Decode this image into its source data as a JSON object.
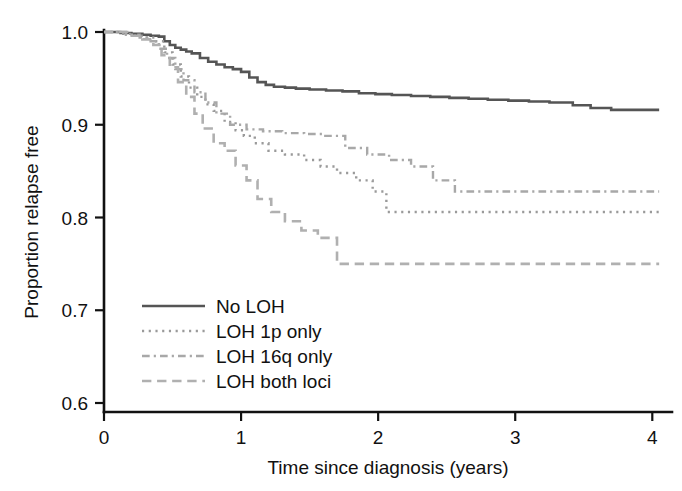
{
  "chart_data": {
    "type": "line",
    "title": "",
    "subtitle": "",
    "xlabel": "Time since diagnosis (years)",
    "ylabel": "Proportion relapse free",
    "xlim": [
      0,
      4.1
    ],
    "ylim": [
      0.6,
      1.0
    ],
    "xticks": [
      0,
      1,
      2,
      3,
      4
    ],
    "xtick_labels": [
      "0",
      "1",
      "2",
      "3",
      "4"
    ],
    "yticks": [
      0.6,
      0.7,
      0.8,
      0.9,
      1.0
    ],
    "ytick_labels": [
      "0.6",
      "0.7",
      "0.8",
      "0.9",
      "1.0"
    ],
    "grid": false,
    "legend_position": "lower-left-inside",
    "step_type": "post",
    "series": [
      {
        "name": "No LOH",
        "dash_style": "solid",
        "color": "#555555",
        "stroke_width": 2.6,
        "x": [
          0.0,
          0.12,
          0.2,
          0.28,
          0.34,
          0.4,
          0.44,
          0.48,
          0.52,
          0.56,
          0.6,
          0.64,
          0.7,
          0.76,
          0.82,
          0.88,
          0.94,
          1.0,
          1.06,
          1.12,
          1.18,
          1.24,
          1.32,
          1.4,
          1.5,
          1.62,
          1.74,
          1.86,
          1.98,
          2.1,
          2.24,
          2.38,
          2.52,
          2.66,
          2.8,
          2.95,
          3.1,
          3.25,
          3.42,
          3.55,
          3.7,
          4.05
        ],
        "y": [
          1.0,
          0.999,
          0.998,
          0.997,
          0.996,
          0.995,
          0.99,
          0.986,
          0.983,
          0.981,
          0.979,
          0.977,
          0.972,
          0.968,
          0.965,
          0.962,
          0.96,
          0.957,
          0.951,
          0.946,
          0.943,
          0.941,
          0.94,
          0.939,
          0.938,
          0.937,
          0.936,
          0.934,
          0.933,
          0.932,
          0.931,
          0.93,
          0.929,
          0.928,
          0.927,
          0.926,
          0.925,
          0.924,
          0.921,
          0.918,
          0.916,
          0.916
        ]
      },
      {
        "name": "LOH 1p only",
        "dash_style": "dotted",
        "color": "#9a9a9a",
        "stroke_width": 2.4,
        "x": [
          0.0,
          0.14,
          0.22,
          0.3,
          0.38,
          0.44,
          0.5,
          0.56,
          0.62,
          0.68,
          0.74,
          0.8,
          0.88,
          0.96,
          1.02,
          1.1,
          1.2,
          1.32,
          1.46,
          1.58,
          1.7,
          1.84,
          1.96,
          2.06,
          4.05
        ],
        "y": [
          1.0,
          0.998,
          0.996,
          0.994,
          0.99,
          0.978,
          0.965,
          0.952,
          0.94,
          0.93,
          0.922,
          0.915,
          0.903,
          0.894,
          0.888,
          0.88,
          0.872,
          0.868,
          0.862,
          0.855,
          0.848,
          0.84,
          0.828,
          0.806,
          0.806
        ]
      },
      {
        "name": "LOH 16q only",
        "dash_style": "dashdot",
        "color": "#a8a8a8",
        "stroke_width": 2.4,
        "x": [
          0.0,
          0.16,
          0.26,
          0.34,
          0.4,
          0.46,
          0.52,
          0.58,
          0.66,
          0.74,
          0.82,
          0.92,
          1.04,
          1.16,
          1.3,
          1.46,
          1.6,
          1.76,
          1.92,
          2.08,
          2.24,
          2.4,
          2.56,
          4.05
        ],
        "y": [
          1.0,
          0.997,
          0.994,
          0.99,
          0.982,
          0.972,
          0.96,
          0.948,
          0.935,
          0.924,
          0.912,
          0.9,
          0.895,
          0.893,
          0.891,
          0.89,
          0.888,
          0.875,
          0.868,
          0.862,
          0.855,
          0.84,
          0.828,
          0.828
        ]
      },
      {
        "name": "LOH both loci",
        "dash_style": "dashed",
        "color": "#b0b0b0",
        "stroke_width": 2.6,
        "x": [
          0.0,
          0.18,
          0.28,
          0.36,
          0.42,
          0.48,
          0.54,
          0.6,
          0.66,
          0.72,
          0.8,
          0.88,
          0.96,
          1.04,
          1.12,
          1.22,
          1.32,
          1.44,
          1.56,
          1.7,
          4.05
        ],
        "y": [
          1.0,
          0.996,
          0.992,
          0.986,
          0.975,
          0.962,
          0.946,
          0.93,
          0.912,
          0.896,
          0.88,
          0.872,
          0.856,
          0.84,
          0.82,
          0.806,
          0.796,
          0.786,
          0.778,
          0.75,
          0.75
        ]
      }
    ]
  },
  "legend": {
    "entries": [
      {
        "label": "No LOH",
        "dash_style": "solid",
        "color": "#555555"
      },
      {
        "label": "LOH 1p only",
        "dash_style": "dotted",
        "color": "#9a9a9a"
      },
      {
        "label": "LOH 16q only",
        "dash_style": "dashdot",
        "color": "#a8a8a8"
      },
      {
        "label": "LOH both loci",
        "dash_style": "dashed",
        "color": "#b0b0b0"
      }
    ]
  },
  "axes": {
    "x_title": "Time since diagnosis (years)",
    "y_title": "Proportion relapse free",
    "x_tick_labels": [
      "0",
      "1",
      "2",
      "3",
      "4"
    ],
    "y_tick_labels": [
      "0.6",
      "0.7",
      "0.8",
      "0.9",
      "1.0"
    ],
    "axis_color": "#111111"
  }
}
